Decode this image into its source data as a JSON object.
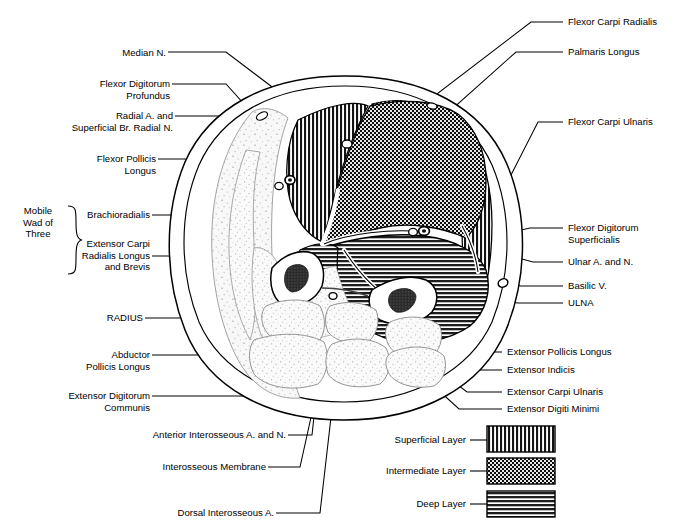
{
  "figure": {
    "group_bracket_label": "Mobile\nWad of\nThree",
    "colors": {
      "ink": "#000000",
      "background": "#ffffff",
      "superficial_fill": "#1b1b1b",
      "intermediate_fill": "#111111",
      "deep_fill": "#2a2a2a",
      "bone_fill": "#ffffff",
      "marrow_fill": "#2b2b2b",
      "soft_tissue_fill": "#f2f2f2",
      "stipple": "#9a9a9a"
    }
  },
  "labels_left": [
    {
      "id": "median-n",
      "text": "Median N."
    },
    {
      "id": "flexor-digitorum-profundus",
      "text": "Flexor Digitorum\nProfundus"
    },
    {
      "id": "radial-a-superficial-br-radial-n",
      "text": "Radial A. and\nSuperficial Br. Radial N."
    },
    {
      "id": "flexor-pollicis-longus",
      "text": "Flexor Pollicis\nLongus"
    },
    {
      "id": "brachioradialis",
      "text": "Brachioradialis"
    },
    {
      "id": "extensor-carpi-radialis-longus-and-brevis",
      "text": "Extensor Carpi\nRadialis Longus\nand Brevis"
    },
    {
      "id": "radius",
      "text": "RADIUS"
    },
    {
      "id": "abductor-pollicis-longus",
      "text": "Abductor\nPollicis Longus"
    },
    {
      "id": "extensor-digitorum-communis",
      "text": "Extensor Digitorum\nCommunis"
    }
  ],
  "labels_bottom": [
    {
      "id": "anterior-interosseous-a-and-n",
      "text": "Anterior Interosseous A. and N."
    },
    {
      "id": "interosseous-membrane",
      "text": "Interosseous Membrane"
    },
    {
      "id": "dorsal-interosseous-a",
      "text": "Dorsal Interosseous A."
    }
  ],
  "labels_right": [
    {
      "id": "flexor-carpi-radialis",
      "text": "Flexor Carpi Radialis"
    },
    {
      "id": "palmaris-longus",
      "text": "Palmaris Longus"
    },
    {
      "id": "flexor-carpi-ulnaris",
      "text": "Flexor Carpi Ulnaris"
    },
    {
      "id": "flexor-digitorum-superficialis",
      "text": "Flexor Digitorum\nSuperficialis"
    },
    {
      "id": "ulnar-a-and-n",
      "text": "Ulnar A. and N."
    },
    {
      "id": "basilic-v",
      "text": "Basilic V."
    },
    {
      "id": "ulna",
      "text": "ULNA"
    },
    {
      "id": "extensor-pollicis-longus",
      "text": "Extensor Pollicis Longus"
    },
    {
      "id": "extensor-indicis",
      "text": "Extensor Indicis"
    },
    {
      "id": "extensor-carpi-ulnaris",
      "text": "Extensor Carpi Ulnaris"
    },
    {
      "id": "extensor-digiti-minimi",
      "text": "Extensor Digiti Minimi"
    }
  ],
  "legend": {
    "items": [
      {
        "id": "superficial-layer",
        "label": "Superficial Layer",
        "pattern": "vertical-lines"
      },
      {
        "id": "intermediate-layer",
        "label": "Intermediate Layer",
        "pattern": "checkerboard"
      },
      {
        "id": "deep-layer",
        "label": "Deep Layer",
        "pattern": "horizontal-lines"
      }
    ]
  }
}
